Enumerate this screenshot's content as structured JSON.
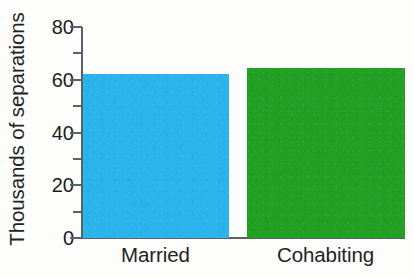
{
  "chart_data": {
    "type": "bar",
    "title": "",
    "subtitle": "",
    "xlabel": "",
    "ylabel": "Thousands of separations",
    "categories": [
      "Married",
      "Cohabiting"
    ],
    "values": [
      62,
      64.5
    ],
    "series": [
      {
        "name": "Separations",
        "values": [
          62,
          64.5
        ],
        "colors": [
          "#2bb4ec",
          "#22a024"
        ]
      }
    ],
    "ylim": [
      0,
      80
    ],
    "xlim": null,
    "y_major_ticks": [
      0,
      20,
      40,
      60,
      80
    ],
    "y_minor_ticks": [
      10,
      30,
      50,
      70
    ],
    "y_tick_labels": [
      "0",
      "20",
      "40",
      "60",
      "80"
    ],
    "grid": false,
    "legend": null,
    "legend_position": "none",
    "annotations": [],
    "axis_color": "#5c6166",
    "text_color": "#232323",
    "background": "#fdfdfc"
  },
  "axis": {
    "y_title": "Thousands of separations",
    "tick_labels": [
      {
        "value": 80,
        "text": "80"
      },
      {
        "value": 60,
        "text": "60"
      },
      {
        "value": 40,
        "text": "40"
      },
      {
        "value": 20,
        "text": "20"
      },
      {
        "value": 0,
        "text": "0"
      }
    ]
  },
  "bars": [
    {
      "label": "Married",
      "value": 62,
      "color": "#2bb4ec"
    },
    {
      "label": "Cohabiting",
      "value": 64.5,
      "color": "#22a024"
    }
  ]
}
